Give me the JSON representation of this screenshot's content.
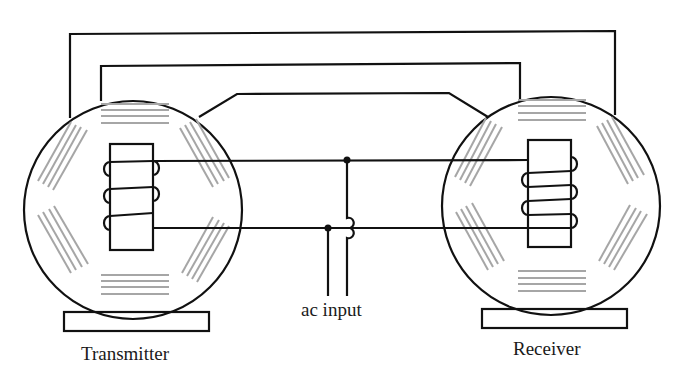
{
  "diagram": {
    "labels": {
      "transmitter": "Transmitter",
      "receiver": "Receiver",
      "ac_input": "ac input"
    },
    "colors": {
      "line": "#111111",
      "winding": "#a6a6a6",
      "background": "#ffffff"
    },
    "components": [
      {
        "id": "transmitter",
        "type": "synchro",
        "stator_windings": 6,
        "rotor_coil_turns": 3
      },
      {
        "id": "receiver",
        "type": "synchro",
        "stator_windings": 6,
        "rotor_coil_turns": 3
      }
    ],
    "connections": [
      "stator lead 1 (transmitter) to stator lead 1 (receiver)",
      "stator lead 2 (transmitter) to stator lead 2 (receiver)",
      "stator lead 3 (transmitter) to stator lead 3 (receiver)",
      "rotors connected in parallel to ac input"
    ]
  }
}
